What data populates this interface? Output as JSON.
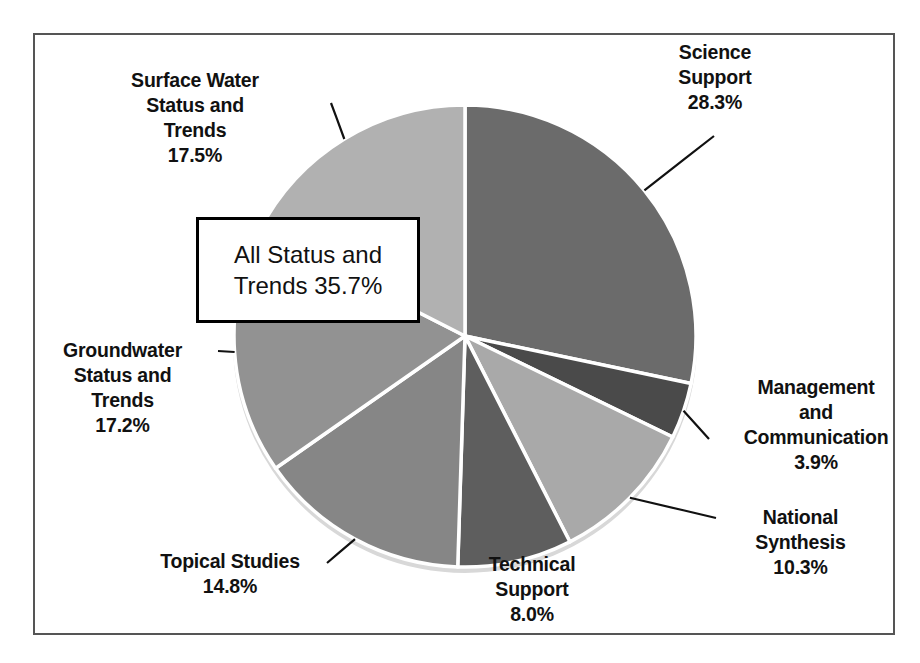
{
  "chart_data": {
    "type": "pie",
    "title": "",
    "subtitle": "",
    "xlabel": "",
    "ylabel": "",
    "legend_position": "none",
    "grid": false,
    "units": "percent",
    "start_angle_deg": 0,
    "direction": "clockwise",
    "categories": [
      "Science Support",
      "Management and Communication",
      "National Synthesis",
      "Technical Support",
      "Topical Studies",
      "Groundwater Status and Trends",
      "Surface Water Status and Trends"
    ],
    "values": [
      28.3,
      3.9,
      10.3,
      8.0,
      14.8,
      17.2,
      17.5
    ],
    "slices": [
      {
        "name": "Science Support",
        "value": 28.3,
        "value_label": "28.3%",
        "label_lines": "Science\nSupport\n28.3%",
        "color": "#6b6b6b"
      },
      {
        "name": "Management and Communication",
        "value": 3.9,
        "value_label": "3.9%",
        "label_lines": "Management\nand\nCommunication\n3.9%",
        "color": "#4a4a4a"
      },
      {
        "name": "National Synthesis",
        "value": 10.3,
        "value_label": "10.3%",
        "label_lines": "National\nSynthesis\n10.3%",
        "color": "#a9a9a9"
      },
      {
        "name": "Technical Support",
        "value": 8.0,
        "value_label": "8.0%",
        "label_lines": "Technical\nSupport\n8.0%",
        "color": "#5e5e5e"
      },
      {
        "name": "Topical Studies",
        "value": 14.8,
        "value_label": "14.8%",
        "label_lines": "Topical Studies\n14.8%",
        "color": "#868686"
      },
      {
        "name": "Groundwater Status and Trends",
        "value": 17.2,
        "value_label": "17.2%",
        "label_lines": "Groundwater\nStatus and\nTrends\n17.2%",
        "color": "#929292"
      },
      {
        "name": "Surface Water Status and Trends",
        "value": 17.5,
        "value_label": "17.5%",
        "label_lines": "Surface Water\nStatus and\nTrends\n17.5%",
        "color": "#b1b1b1"
      }
    ],
    "annotations": [
      {
        "name": "all-status-and-trends-callout",
        "text": "All Status and\nTrends 35.7%",
        "value": 35.7,
        "value_label": "35.7%",
        "covers": [
          "Groundwater Status and Trends",
          "Surface Water Status and Trends"
        ]
      }
    ]
  },
  "colors": {
    "frame_border": "#555555",
    "slice_separator": "#ffffff",
    "callout_border": "#000000",
    "text": "#111111",
    "background": "#ffffff"
  }
}
